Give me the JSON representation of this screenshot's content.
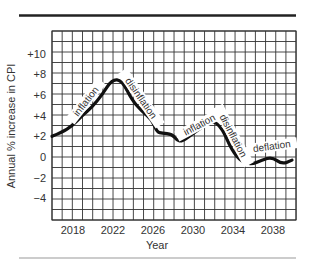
{
  "chart_data": {
    "type": "line",
    "title": "",
    "xlabel": "Year",
    "ylabel": "Annual % increase in CPI",
    "xlim": [
      2016,
      2040.4
    ],
    "ylim": [
      -6.3,
      12.2
    ],
    "grid": true,
    "x_ticks": [
      2018,
      2022,
      2026,
      2030,
      2034,
      2038
    ],
    "x_tick_labels": [
      "2018",
      "2022",
      "2026",
      "2030",
      "2034",
      "2038"
    ],
    "y_ticks": [
      10,
      8,
      6,
      4,
      2,
      0,
      -2,
      -4
    ],
    "y_tick_labels": [
      "+10",
      "+8",
      "+6",
      "+4",
      "+2",
      "0",
      "−2",
      "−4"
    ],
    "series": [
      {
        "name": "CPI change",
        "x": [
          2016,
          2017,
          2018,
          2019,
          2020,
          2021,
          2022,
          2023,
          2024,
          2025,
          2026,
          2026.5,
          2027,
          2028,
          2028.5,
          2029,
          2030,
          2031,
          2032,
          2033,
          2034,
          2035,
          2036,
          2037,
          2038,
          2039,
          2040
        ],
        "values": [
          2.0,
          2.4,
          3.0,
          4.0,
          4.8,
          6.0,
          7.5,
          7.4,
          5.5,
          4.4,
          3.6,
          2.4,
          2.3,
          2.2,
          1.6,
          1.5,
          2.2,
          2.9,
          3.6,
          2.8,
          0.6,
          -0.5,
          -0.7,
          -0.3,
          0.0,
          -0.7,
          -0.3
        ]
      }
    ],
    "annotations": [
      {
        "text": "inflation",
        "x": 2019.5,
        "y": 5.3,
        "angle": -52
      },
      {
        "text": "disinflation",
        "x": 2024.8,
        "y": 5.6,
        "angle": 55
      },
      {
        "text": "inflation",
        "x": 2030.8,
        "y": 3.0,
        "angle": -28
      },
      {
        "text": "disinflation",
        "x": 2034.0,
        "y": 2.0,
        "angle": 62
      },
      {
        "text": "deflation",
        "x": 2038.0,
        "y": 0.9,
        "angle": -8
      }
    ],
    "legend": null
  }
}
